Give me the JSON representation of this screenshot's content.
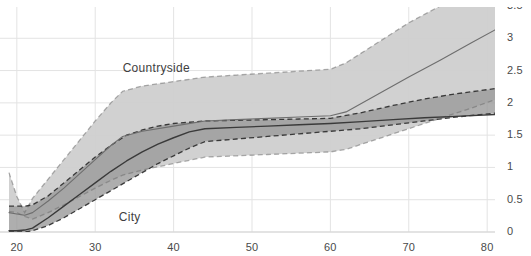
{
  "chart_data": {
    "type": "line",
    "title": "",
    "xlabel": "",
    "ylabel": "",
    "xlim": [
      19,
      81
    ],
    "ylim": [
      0,
      3.5
    ],
    "xticks": [
      20,
      30,
      40,
      50,
      60,
      70,
      80
    ],
    "xtick_labels": [
      "20",
      "30",
      "40",
      "50",
      "60",
      "70",
      "80"
    ],
    "yticks": [
      0,
      0.5,
      1,
      1.5,
      2,
      2.5,
      3,
      3.5
    ],
    "ytick_labels": [
      "0",
      "0.5",
      "1",
      "1.5",
      "2",
      "2.5",
      "3",
      "3.5"
    ],
    "y_axis_side": "right",
    "grid": true,
    "legend_position": "inline-annotation",
    "annotations": [
      {
        "text": "Countryside",
        "x": 33.5,
        "y": 2.52
      },
      {
        "text": "City",
        "x": 33.0,
        "y": 0.22
      }
    ],
    "colors": {
      "countryside_band": "#cfcfcf",
      "countryside_line": "#6e6e6e",
      "city_band": "#9a9a9a",
      "city_line": "#3a3a3a",
      "grid": "#e3e3e3",
      "axis_text": "#4a4a4a",
      "background": "#ffffff"
    },
    "series": [
      {
        "name": "Countryside",
        "style": "solid",
        "x": [
          19,
          20,
          21,
          22,
          24,
          26,
          28,
          30,
          32,
          33.5,
          36,
          40,
          44,
          48,
          52,
          56,
          60,
          62,
          66,
          70,
          74,
          78,
          81
        ],
        "values": [
          0.3,
          0.28,
          0.26,
          0.3,
          0.48,
          0.68,
          0.9,
          1.12,
          1.34,
          1.48,
          1.56,
          1.64,
          1.72,
          1.74,
          1.76,
          1.78,
          1.8,
          1.86,
          2.13,
          2.4,
          2.66,
          2.93,
          3.13
        ],
        "band_upper": [
          0.92,
          0.55,
          0.3,
          0.52,
          0.82,
          1.12,
          1.42,
          1.72,
          2.0,
          2.18,
          2.26,
          2.33,
          2.4,
          2.43,
          2.46,
          2.49,
          2.52,
          2.62,
          2.93,
          3.24,
          3.5,
          3.5,
          3.5
        ],
        "band_lower": [
          0.32,
          0.3,
          0.24,
          0.2,
          0.3,
          0.42,
          0.55,
          0.68,
          0.8,
          0.88,
          0.96,
          1.06,
          1.16,
          1.18,
          1.2,
          1.22,
          1.24,
          1.28,
          1.44,
          1.6,
          1.76,
          1.92,
          2.05
        ]
      },
      {
        "name": "City",
        "style": "solid",
        "x": [
          19,
          20,
          21,
          22,
          24,
          26,
          28,
          30,
          32,
          34,
          36,
          38,
          40,
          42,
          44,
          48,
          52,
          56,
          60,
          64,
          68,
          72,
          76,
          81
        ],
        "values": [
          0.02,
          0.02,
          0.03,
          0.06,
          0.22,
          0.4,
          0.58,
          0.76,
          0.94,
          1.1,
          1.24,
          1.36,
          1.46,
          1.55,
          1.6,
          1.62,
          1.64,
          1.66,
          1.68,
          1.71,
          1.74,
          1.77,
          1.79,
          1.82
        ],
        "band_upper": [
          0.4,
          0.4,
          0.4,
          0.42,
          0.56,
          0.76,
          0.96,
          1.16,
          1.34,
          1.5,
          1.58,
          1.64,
          1.68,
          1.7,
          1.72,
          1.73,
          1.74,
          1.75,
          1.76,
          1.85,
          1.96,
          2.06,
          2.14,
          2.22
        ],
        "band_lower": [
          0.0,
          0.0,
          0.0,
          0.02,
          0.1,
          0.22,
          0.36,
          0.5,
          0.64,
          0.78,
          0.92,
          1.06,
          1.18,
          1.3,
          1.4,
          1.44,
          1.48,
          1.52,
          1.56,
          1.6,
          1.66,
          1.72,
          1.78,
          1.84
        ]
      }
    ],
    "band_boundary_style": "dashed"
  }
}
